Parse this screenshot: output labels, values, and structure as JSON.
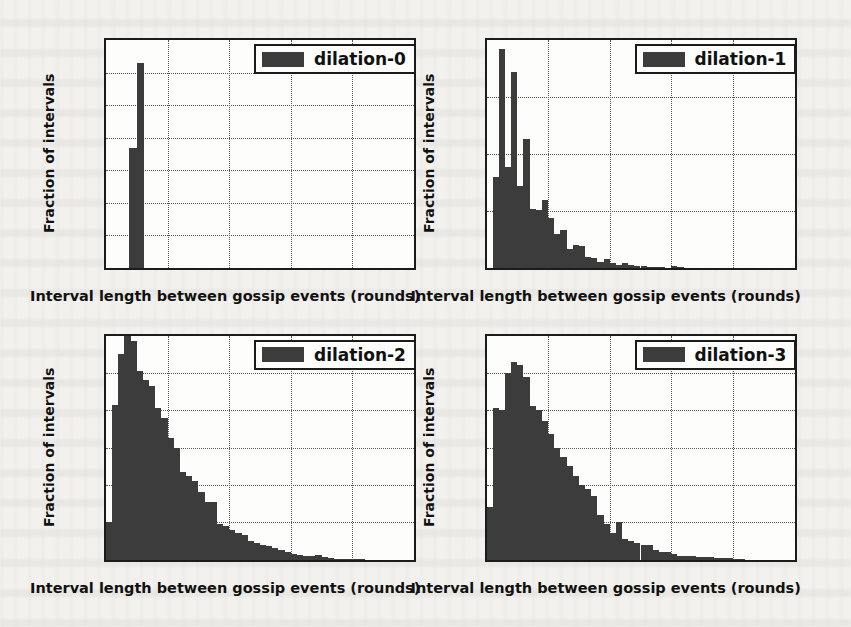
{
  "figure": {
    "panels": [
      "dilation-0",
      "dilation-1",
      "dilation-2",
      "dilation-3"
    ],
    "shared_xlabel": "Interval length between gossip events (rounds)",
    "shared_ylabel": "Fraction of intervals",
    "bar_color": "#3c3c3c",
    "axes_color": "#1b1b1b",
    "background_color": "#f2f1ee"
  },
  "chart_data": [
    {
      "type": "bar",
      "title": "",
      "legend": "dilation-0",
      "legend_position": "upper right",
      "xlabel": "Interval length between gossip events (rounds)",
      "ylabel": "Fraction of intervals",
      "xlim": [
        0,
        10
      ],
      "ylim": [
        0.0,
        0.7
      ],
      "xticks": [
        0,
        2,
        4,
        6,
        8,
        10
      ],
      "xtick_labels": [
        "0",
        "2",
        "4",
        "6",
        "8",
        "10"
      ],
      "yticks": [
        0.0,
        0.1,
        0.2,
        0.3,
        0.4,
        0.5,
        0.6,
        0.7
      ],
      "ytick_labels": [
        "0.0",
        "0.1",
        "0.2",
        "0.3",
        "0.4",
        "0.5",
        "0.6",
        "0.7"
      ],
      "grid": true,
      "bin_width": 0.25,
      "bin_edges": [
        0.75,
        1.0,
        1.25
      ],
      "values": [
        0.37,
        0.63
      ]
    },
    {
      "type": "bar",
      "title": "",
      "legend": "dilation-1",
      "legend_position": "upper right",
      "xlabel": "Interval length between gossip events (rounds)",
      "ylabel": "Fraction of intervals",
      "xlim": [
        0,
        10
      ],
      "ylim": [
        0.0,
        0.2
      ],
      "xticks": [
        0,
        2,
        4,
        6,
        8,
        10
      ],
      "xtick_labels": [
        "0",
        "2",
        "4",
        "6",
        "8",
        "10"
      ],
      "yticks": [
        0.0,
        0.05,
        0.1,
        0.15,
        0.2
      ],
      "ytick_labels": [
        "0.00",
        "0.05",
        "0.10",
        "0.15",
        "0.20"
      ],
      "grid": true,
      "bin_width": 0.2,
      "bin_start": 0.2,
      "values": [
        0.08,
        0.192,
        0.089,
        0.172,
        0.072,
        0.113,
        0.052,
        0.051,
        0.06,
        0.044,
        0.03,
        0.033,
        0.017,
        0.02,
        0.019,
        0.01,
        0.009,
        0.005,
        0.008,
        0.004,
        0.003,
        0.004,
        0.003,
        0.002,
        0.002,
        0.001,
        0.001,
        0.0005,
        0.0,
        0.002,
        0.0005,
        0.0,
        0.0,
        0.0,
        0.0,
        0.0,
        0.0,
        0.0,
        0.0,
        0.0,
        0.0,
        0.0,
        0.0,
        0.0,
        0.0,
        0.0,
        0.0,
        0.0,
        0.0
      ]
    },
    {
      "type": "bar",
      "title": "",
      "legend": "dilation-2",
      "legend_position": "upper right",
      "xlabel": "Interval length between gossip events (rounds)",
      "ylabel": "Fraction of intervals",
      "xlim": [
        0,
        10
      ],
      "ylim": [
        0.0,
        0.12
      ],
      "xticks": [
        0,
        2,
        4,
        6,
        8,
        10
      ],
      "xtick_labels": [
        "0",
        "2",
        "4",
        "6",
        "8",
        "10"
      ],
      "yticks": [
        0.0,
        0.02,
        0.04,
        0.06,
        0.08,
        0.1,
        0.12
      ],
      "ytick_labels": [
        "0.00",
        "0.02",
        "0.04",
        "0.06",
        "0.08",
        "0.10",
        "0.12"
      ],
      "grid": true,
      "bin_width": 0.2,
      "bin_start": 0.0,
      "values": [
        0.02,
        0.083,
        0.11,
        0.122,
        0.117,
        0.101,
        0.096,
        0.093,
        0.081,
        0.076,
        0.065,
        0.06,
        0.047,
        0.045,
        0.042,
        0.036,
        0.031,
        0.031,
        0.019,
        0.018,
        0.016,
        0.014,
        0.013,
        0.01,
        0.009,
        0.008,
        0.007,
        0.006,
        0.005,
        0.004,
        0.003,
        0.0025,
        0.002,
        0.0018,
        0.0022,
        0.0015,
        0.0008,
        0.0005,
        0.0003,
        0.0002,
        0.0002,
        0.0001,
        0.0,
        0.0,
        0.0,
        0.0,
        0.0,
        0.0,
        0.0,
        0.0
      ]
    },
    {
      "type": "bar",
      "title": "",
      "legend": "dilation-3",
      "legend_position": "upper right",
      "xlabel": "Interval length between gossip events (rounds)",
      "ylabel": "Fraction of intervals",
      "xlim": [
        0,
        10
      ],
      "ylim": [
        0.0,
        0.12
      ],
      "xticks": [
        0,
        2,
        4,
        6,
        8,
        10
      ],
      "xtick_labels": [
        "0",
        "2",
        "4",
        "6",
        "8",
        "10"
      ],
      "yticks": [
        0.0,
        0.02,
        0.04,
        0.06,
        0.08,
        0.1,
        0.12
      ],
      "ytick_labels": [
        "0.00",
        "0.02",
        "0.04",
        "0.06",
        "0.08",
        "0.10",
        "0.12"
      ],
      "grid": true,
      "bin_width": 0.2,
      "bin_start": 0.0,
      "values": [
        0.028,
        0.081,
        0.08,
        0.1,
        0.106,
        0.104,
        0.098,
        0.082,
        0.08,
        0.074,
        0.067,
        0.06,
        0.055,
        0.05,
        0.045,
        0.04,
        0.038,
        0.034,
        0.024,
        0.019,
        0.014,
        0.02,
        0.011,
        0.01,
        0.009,
        0.008,
        0.008,
        0.005,
        0.004,
        0.004,
        0.003,
        0.002,
        0.002,
        0.0018,
        0.0015,
        0.0012,
        0.0015,
        0.001,
        0.0008,
        0.0008,
        0.0004,
        0.0002,
        0.0,
        0.0,
        0.0,
        0.0,
        0.0,
        0.0,
        0.0,
        0.0
      ]
    }
  ]
}
